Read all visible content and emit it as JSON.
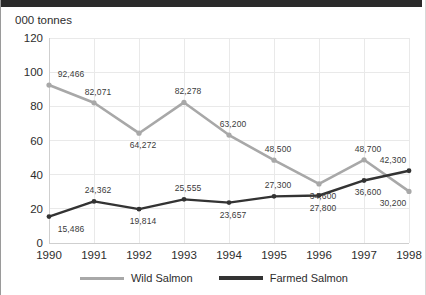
{
  "chart_data": {
    "type": "line",
    "title": "000 tonnes",
    "xlabel": "",
    "ylabel": "000 tonnes",
    "categories": [
      "1990",
      "1991",
      "1992",
      "1993",
      "1994",
      "1995",
      "1996",
      "1997",
      "1998"
    ],
    "ylim": [
      0,
      120
    ],
    "yticks": [
      0,
      20,
      40,
      60,
      80,
      100,
      120
    ],
    "ytick_labels": [
      "0",
      "20",
      "40",
      "60",
      "80",
      "100",
      "120"
    ],
    "grid": true,
    "legend_position": "bottom",
    "units": "thousand tonnes",
    "series": [
      {
        "name": "Wild Salmon",
        "color": "#a8a8a8",
        "values": [
          92.466,
          82.071,
          64.272,
          82.278,
          63.2,
          48.5,
          34.6,
          48.7,
          30.2
        ],
        "data_labels": [
          "92,466",
          "82,071",
          "64,272",
          "82,278",
          "63,200",
          "48,500",
          "34,600",
          "48,700",
          "30,200"
        ],
        "label_positions": [
          "above",
          "above",
          "below",
          "above",
          "above",
          "above",
          "below",
          "above",
          "below"
        ]
      },
      {
        "name": "Farmed Salmon",
        "color": "#333333",
        "values": [
          15.486,
          24.362,
          19.814,
          25.555,
          23.657,
          27.3,
          27.8,
          36.6,
          42.3
        ],
        "data_labels": [
          "15,486",
          "24,362",
          "19,814",
          "25,555",
          "23,657",
          "27,300",
          "27,800",
          "36,600",
          "42,300"
        ],
        "label_positions": [
          "below",
          "above",
          "below",
          "above",
          "below",
          "above",
          "below",
          "below",
          "above"
        ]
      }
    ]
  },
  "legend": {
    "items": [
      {
        "label": "Wild Salmon",
        "swatch": "wild"
      },
      {
        "label": "Farmed Salmon",
        "swatch": "farmed"
      }
    ]
  },
  "colors": {
    "wild_salmon": "#a8a8a8",
    "farmed_salmon": "#333333",
    "grid": "#e9e9e9",
    "axis": "#cfcfcf",
    "text": "#2d2d2d"
  }
}
